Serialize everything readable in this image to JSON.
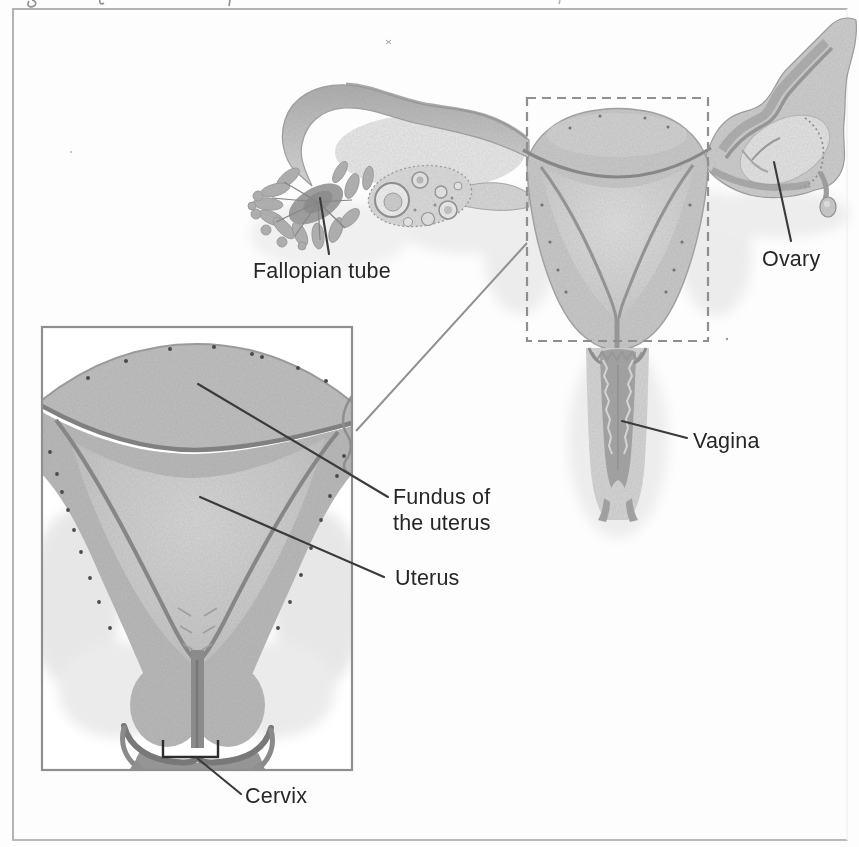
{
  "figure": {
    "labels": {
      "fallopian_tube": "Fallopian tube",
      "ovary": "Ovary",
      "vagina": "Vagina",
      "fundus_lines": [
        "Fundus of",
        "the uterus"
      ],
      "uterus": "Uterus",
      "cervix": "Cervix"
    },
    "colors": {
      "frame_border": "#b3b3b3",
      "inset_border": "#8f8f8f",
      "dashed_box": "#8f8f8f",
      "connector_line": "#919191",
      "leader_line": "#3a3a3a",
      "label_text": "#262626",
      "tissue_light": "#e7e7e7",
      "tissue_mid": "#c9c9c9",
      "tissue_wall": "#b9b9b9",
      "tissue_dark": "#8b8b8b"
    }
  }
}
